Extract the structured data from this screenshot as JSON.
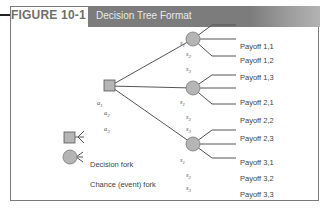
{
  "figure": {
    "label": "FIGURE 10-1",
    "title": "Decision Tree Format"
  },
  "tree": {
    "decision_node": {
      "shape": "square",
      "color": "#b5b5b5"
    },
    "actions": [
      "a1",
      "a2",
      "a3"
    ],
    "action_labels": [
      {
        "base": "a",
        "sub": "1"
      },
      {
        "base": "a",
        "sub": "2"
      },
      {
        "base": "a",
        "sub": "3"
      }
    ],
    "chance_nodes": [
      {
        "branches": [
          {
            "state": {
              "base": "s",
              "sub": "1"
            },
            "payoff": "Payoff 1,1"
          },
          {
            "state": {
              "base": "s",
              "sub": "2"
            },
            "payoff": "Payoff 1,2"
          },
          {
            "state": {
              "base": "s",
              "sub": "3"
            },
            "payoff": "Payoff 1,3"
          }
        ]
      },
      {
        "branches": [
          {
            "state": {
              "base": "s",
              "sub": "1"
            },
            "payoff": "Payoff 2,1"
          },
          {
            "state": {
              "base": "s",
              "sub": "2"
            },
            "payoff": "Payoff 2,2"
          },
          {
            "state": {
              "base": "s",
              "sub": "3"
            },
            "payoff": "Payoff 2,3"
          }
        ]
      },
      {
        "branches": [
          {
            "state": {
              "base": "s",
              "sub": "1"
            },
            "payoff": "Payoff 3,1"
          },
          {
            "state": {
              "base": "s",
              "sub": "2"
            },
            "payoff": "Payoff 3,2"
          },
          {
            "state": {
              "base": "s",
              "sub": "3"
            },
            "payoff": "Payoff 3,3"
          }
        ]
      }
    ]
  },
  "legend": {
    "decision": "Decision fork",
    "chance": "Chance (event) fork"
  },
  "colors": {
    "node_fill": "#b5b5b5",
    "line": "#555555",
    "title_bar": "#7c7c7c"
  }
}
